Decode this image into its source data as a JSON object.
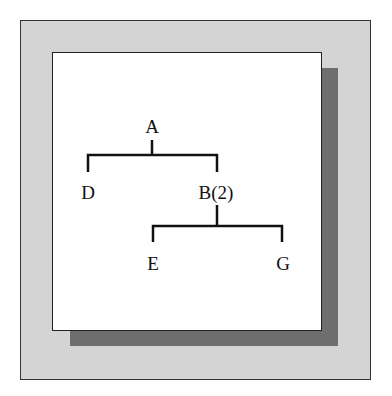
{
  "diagram": {
    "type": "tree",
    "nodes": {
      "root": "A",
      "left": "D",
      "right": "B(2)",
      "right_left": "E",
      "right_right": "G"
    },
    "edges": [
      [
        "A",
        "D"
      ],
      [
        "A",
        "B(2)"
      ],
      [
        "B(2)",
        "E"
      ],
      [
        "B(2)",
        "G"
      ]
    ]
  },
  "colors": {
    "frame": "#d4d4d4",
    "shadow": "#6e6e6e",
    "panel": "#ffffff",
    "line": "#111111"
  }
}
